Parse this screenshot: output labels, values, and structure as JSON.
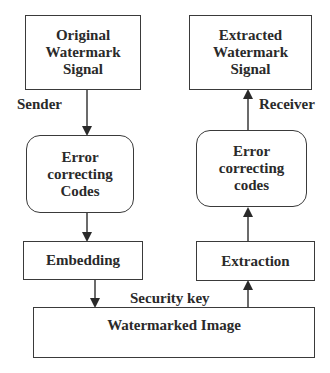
{
  "diagram": {
    "type": "flowchart",
    "sender_side": {
      "label": "Sender",
      "nodes": [
        {
          "id": "original",
          "lines": [
            "Original",
            "Watermark",
            "Signal"
          ],
          "shape": "rectangle"
        },
        {
          "id": "ecc_encode",
          "lines": [
            "Error",
            "correcting",
            "Codes"
          ],
          "shape": "rounded-rectangle"
        },
        {
          "id": "embedding",
          "lines": [
            "Embedding"
          ],
          "shape": "rectangle"
        }
      ]
    },
    "receiver_side": {
      "label": "Receiver",
      "nodes": [
        {
          "id": "extraction",
          "lines": [
            "Extraction"
          ],
          "shape": "rectangle"
        },
        {
          "id": "ecc_decode",
          "lines": [
            "Error",
            "correcting",
            "codes"
          ],
          "shape": "rounded-rectangle"
        },
        {
          "id": "extracted",
          "lines": [
            "Extracted",
            "Watermark",
            "Signal"
          ],
          "shape": "rectangle"
        }
      ]
    },
    "shared_node": {
      "id": "watermarked",
      "lines": [
        "Watermarked Image"
      ],
      "shape": "rectangle"
    },
    "security_key_label": "Security key",
    "edges": [
      {
        "from": "original",
        "to": "ecc_encode"
      },
      {
        "from": "ecc_encode",
        "to": "embedding"
      },
      {
        "from": "embedding",
        "to": "watermarked"
      },
      {
        "from": "watermarked",
        "to": "extraction"
      },
      {
        "from": "extraction",
        "to": "ecc_decode"
      },
      {
        "from": "ecc_decode",
        "to": "extracted"
      }
    ],
    "colors": {
      "stroke": "#3a3a3a",
      "text": "#2a2a2a",
      "background": "#ffffff"
    }
  }
}
